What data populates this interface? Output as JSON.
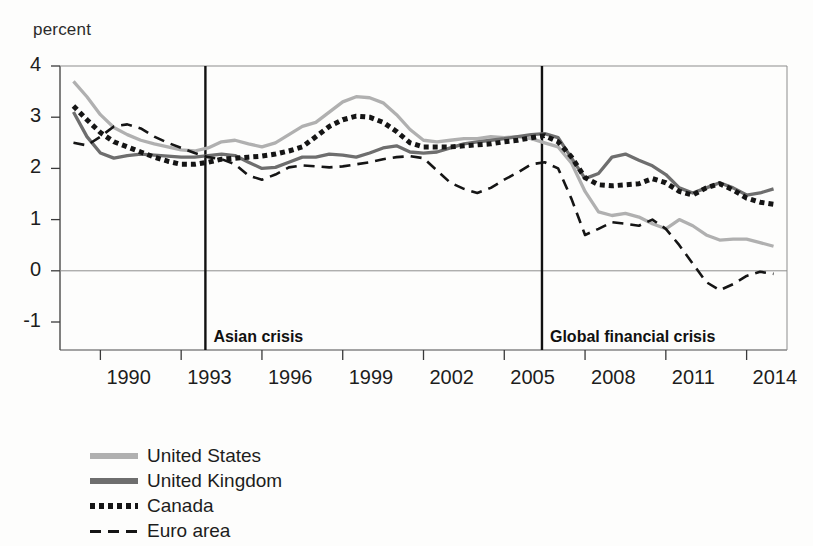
{
  "chart_data": {
    "type": "line",
    "title": "",
    "ylabel": "percent",
    "xlabel": "",
    "ylim": [
      -1.4,
      4
    ],
    "xlim": [
      1988.5,
      2015.5
    ],
    "grid": false,
    "legend_position": "bottom-left",
    "ytick_labels": [
      "4",
      "3",
      "2",
      "1",
      "0",
      "-1"
    ],
    "ytick_values": [
      4,
      3,
      2,
      1,
      0,
      -1
    ],
    "xtick_labels": [
      "1990",
      "1993",
      "1996",
      "1999",
      "2002",
      "2005",
      "2008",
      "2011",
      "2014"
    ],
    "xtick_values": [
      1990,
      1993,
      1996,
      1999,
      2002,
      2005,
      2008,
      2011,
      2014
    ],
    "annotations": [
      {
        "label": "Asian crisis",
        "x": 1993.9
      },
      {
        "label": "Global financial crisis",
        "x": 2006.4
      }
    ],
    "x": [
      1989.0,
      1989.5,
      1990.0,
      1990.5,
      1991.0,
      1991.5,
      1992.0,
      1992.5,
      1993.0,
      1993.5,
      1994.0,
      1994.5,
      1995.0,
      1995.5,
      1996.0,
      1996.5,
      1997.0,
      1997.5,
      1998.0,
      1998.5,
      1999.0,
      1999.5,
      2000.0,
      2000.5,
      2001.0,
      2001.5,
      2002.0,
      2002.5,
      2003.0,
      2003.5,
      2004.0,
      2004.5,
      2005.0,
      2005.5,
      2006.0,
      2006.5,
      2007.0,
      2007.5,
      2008.0,
      2008.5,
      2009.0,
      2009.5,
      2010.0,
      2010.5,
      2011.0,
      2011.5,
      2012.0,
      2012.5,
      2013.0,
      2013.5,
      2014.0,
      2014.5,
      2015.0
    ],
    "series": [
      {
        "name": "United States",
        "color": "#b0b0b0",
        "style": "solid",
        "values": [
          3.7,
          3.4,
          3.05,
          2.8,
          2.66,
          2.55,
          2.48,
          2.42,
          2.36,
          2.34,
          2.4,
          2.52,
          2.55,
          2.48,
          2.42,
          2.5,
          2.66,
          2.82,
          2.9,
          3.1,
          3.3,
          3.4,
          3.38,
          3.28,
          3.05,
          2.76,
          2.55,
          2.52,
          2.55,
          2.58,
          2.58,
          2.62,
          2.6,
          2.62,
          2.58,
          2.5,
          2.42,
          2.1,
          1.55,
          1.15,
          1.08,
          1.12,
          1.05,
          0.92,
          0.82,
          1.0,
          0.88,
          0.7,
          0.6,
          0.62,
          0.62,
          0.55,
          0.48
        ]
      },
      {
        "name": "United Kingdom",
        "color": "#6e6e6e",
        "style": "solid",
        "values": [
          3.1,
          2.62,
          2.3,
          2.2,
          2.25,
          2.28,
          2.26,
          2.24,
          2.22,
          2.22,
          2.25,
          2.28,
          2.25,
          2.12,
          2.0,
          2.02,
          2.12,
          2.22,
          2.22,
          2.28,
          2.26,
          2.22,
          2.3,
          2.4,
          2.44,
          2.32,
          2.3,
          2.32,
          2.4,
          2.48,
          2.52,
          2.55,
          2.58,
          2.62,
          2.66,
          2.68,
          2.6,
          2.2,
          1.8,
          1.9,
          2.22,
          2.28,
          2.16,
          2.05,
          1.88,
          1.62,
          1.52,
          1.62,
          1.72,
          1.62,
          1.48,
          1.52,
          1.6
        ]
      },
      {
        "name": "Canada",
        "color": "#151515",
        "style": "dotted",
        "values": [
          3.22,
          2.95,
          2.7,
          2.52,
          2.42,
          2.32,
          2.22,
          2.14,
          2.08,
          2.08,
          2.12,
          2.18,
          2.2,
          2.22,
          2.24,
          2.28,
          2.34,
          2.42,
          2.62,
          2.82,
          2.95,
          3.02,
          3.0,
          2.9,
          2.72,
          2.5,
          2.42,
          2.42,
          2.42,
          2.44,
          2.46,
          2.48,
          2.52,
          2.55,
          2.6,
          2.64,
          2.52,
          2.22,
          1.82,
          1.68,
          1.66,
          1.68,
          1.7,
          1.8,
          1.72,
          1.55,
          1.48,
          1.62,
          1.7,
          1.58,
          1.42,
          1.34,
          1.3
        ]
      },
      {
        "name": "Euro area",
        "color": "#151515",
        "style": "dashed",
        "values": [
          2.5,
          2.45,
          2.62,
          2.82,
          2.86,
          2.78,
          2.62,
          2.5,
          2.4,
          2.3,
          2.22,
          2.18,
          2.08,
          1.86,
          1.78,
          1.88,
          2.02,
          2.06,
          2.04,
          2.02,
          2.04,
          2.08,
          2.12,
          2.18,
          2.22,
          2.24,
          2.2,
          1.96,
          1.72,
          1.6,
          1.52,
          1.62,
          1.78,
          1.92,
          2.08,
          2.12,
          2.0,
          1.4,
          0.7,
          0.82,
          0.95,
          0.92,
          0.88,
          1.0,
          0.82,
          0.5,
          0.14,
          -0.22,
          -0.38,
          -0.26,
          -0.1,
          -0.02,
          -0.06
        ]
      }
    ]
  },
  "legend": {
    "items": [
      {
        "label": "United States",
        "swatch": "sw-solid-light"
      },
      {
        "label": "United Kingdom",
        "swatch": "sw-solid-dark"
      },
      {
        "label": "Canada",
        "swatch": "sw-dotted"
      },
      {
        "label": "Euro area",
        "swatch": "sw-dashed"
      }
    ]
  }
}
